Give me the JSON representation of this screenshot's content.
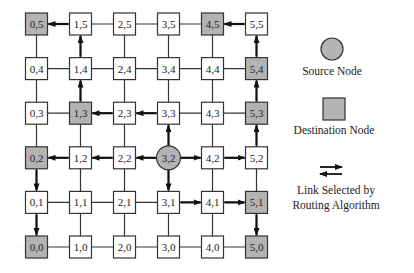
{
  "grid": {
    "cols": 6,
    "rows": 6,
    "origin_x": 36.5,
    "origin_y": 247,
    "spacing_x": 44,
    "spacing_y": 44.6,
    "node_size": 22,
    "colors": {
      "normal_fill": "#ffffff",
      "destination_fill": "#b3b3b3",
      "source_fill": "#b3b3b3",
      "stroke": "#333333",
      "link": "#333333",
      "selected_link": "#111111"
    }
  },
  "nodes": [
    {
      "x": 0,
      "y": 5,
      "label": "0,5",
      "type": "destination"
    },
    {
      "x": 1,
      "y": 5,
      "label": "1,5",
      "type": "normal"
    },
    {
      "x": 2,
      "y": 5,
      "label": "2,5",
      "type": "normal"
    },
    {
      "x": 3,
      "y": 5,
      "label": "3,5",
      "type": "normal"
    },
    {
      "x": 4,
      "y": 5,
      "label": "4,5",
      "type": "destination"
    },
    {
      "x": 5,
      "y": 5,
      "label": "5,5",
      "type": "normal"
    },
    {
      "x": 0,
      "y": 4,
      "label": "0,4",
      "type": "normal"
    },
    {
      "x": 1,
      "y": 4,
      "label": "1,4",
      "type": "normal"
    },
    {
      "x": 2,
      "y": 4,
      "label": "2,4",
      "type": "normal"
    },
    {
      "x": 3,
      "y": 4,
      "label": "3,4",
      "type": "normal"
    },
    {
      "x": 4,
      "y": 4,
      "label": "4,4",
      "type": "normal"
    },
    {
      "x": 5,
      "y": 4,
      "label": "5,4",
      "type": "destination"
    },
    {
      "x": 0,
      "y": 3,
      "label": "0,3",
      "type": "normal"
    },
    {
      "x": 1,
      "y": 3,
      "label": "1,3",
      "type": "destination"
    },
    {
      "x": 2,
      "y": 3,
      "label": "2,3",
      "type": "normal"
    },
    {
      "x": 3,
      "y": 3,
      "label": "3,3",
      "type": "normal"
    },
    {
      "x": 4,
      "y": 3,
      "label": "4,3",
      "type": "normal"
    },
    {
      "x": 5,
      "y": 3,
      "label": "5,3",
      "type": "destination"
    },
    {
      "x": 0,
      "y": 2,
      "label": "0,2",
      "type": "destination"
    },
    {
      "x": 1,
      "y": 2,
      "label": "1,2",
      "type": "normal"
    },
    {
      "x": 2,
      "y": 2,
      "label": "2,2",
      "type": "normal"
    },
    {
      "x": 3,
      "y": 2,
      "label": "3,2",
      "type": "source"
    },
    {
      "x": 4,
      "y": 2,
      "label": "4,2",
      "type": "normal"
    },
    {
      "x": 5,
      "y": 2,
      "label": "5,2",
      "type": "normal"
    },
    {
      "x": 0,
      "y": 1,
      "label": "0,1",
      "type": "normal"
    },
    {
      "x": 1,
      "y": 1,
      "label": "1,1",
      "type": "normal"
    },
    {
      "x": 2,
      "y": 1,
      "label": "2,1",
      "type": "normal"
    },
    {
      "x": 3,
      "y": 1,
      "label": "3,1",
      "type": "normal"
    },
    {
      "x": 4,
      "y": 1,
      "label": "4,1",
      "type": "normal"
    },
    {
      "x": 5,
      "y": 1,
      "label": "5,1",
      "type": "destination"
    },
    {
      "x": 0,
      "y": 0,
      "label": "0,0",
      "type": "destination"
    },
    {
      "x": 1,
      "y": 0,
      "label": "1,0",
      "type": "normal"
    },
    {
      "x": 2,
      "y": 0,
      "label": "2,0",
      "type": "normal"
    },
    {
      "x": 3,
      "y": 0,
      "label": "3,0",
      "type": "normal"
    },
    {
      "x": 4,
      "y": 0,
      "label": "4,0",
      "type": "normal"
    },
    {
      "x": 5,
      "y": 0,
      "label": "5,0",
      "type": "destination"
    }
  ],
  "selected_links": [
    {
      "from": "3,2",
      "to": "2,2"
    },
    {
      "from": "2,2",
      "to": "1,2"
    },
    {
      "from": "1,2",
      "to": "0,2"
    },
    {
      "from": "0,2",
      "to": "0,1"
    },
    {
      "from": "0,1",
      "to": "0,0"
    },
    {
      "from": "3,2",
      "to": "3,3"
    },
    {
      "from": "3,3",
      "to": "2,3"
    },
    {
      "from": "2,3",
      "to": "1,3"
    },
    {
      "from": "1,3",
      "to": "1,4"
    },
    {
      "from": "1,4",
      "to": "1,5"
    },
    {
      "from": "1,5",
      "to": "0,5"
    },
    {
      "from": "3,2",
      "to": "4,2"
    },
    {
      "from": "4,2",
      "to": "5,2"
    },
    {
      "from": "5,2",
      "to": "5,3"
    },
    {
      "from": "5,3",
      "to": "5,4"
    },
    {
      "from": "5,4",
      "to": "5,5"
    },
    {
      "from": "5,5",
      "to": "4,5"
    },
    {
      "from": "3,2",
      "to": "3,1"
    },
    {
      "from": "3,1",
      "to": "4,1"
    },
    {
      "from": "4,1",
      "to": "5,1"
    },
    {
      "from": "5,1",
      "to": "5,0"
    }
  ],
  "legend": {
    "source_label": "Source Node",
    "destination_label": "Destination Node",
    "link_label_line1": "Link Selected by",
    "link_label_line2": "Routing Algorithm"
  }
}
